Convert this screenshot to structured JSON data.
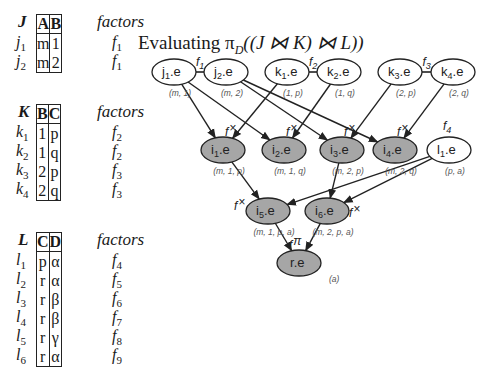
{
  "title_parts": {
    "prefix": "Evaluating ",
    "pi": "π",
    "pi_sub": "D",
    "expr": "((J ⋈ K) ⋈ L))"
  },
  "tables": [
    {
      "name": "J",
      "columns": [
        "A",
        "B"
      ],
      "factors_header": "factors",
      "rows": [
        {
          "label": "j",
          "idx": "1",
          "cells": [
            "m",
            "1"
          ],
          "factor": "f",
          "factor_idx": "1"
        },
        {
          "label": "j",
          "idx": "2",
          "cells": [
            "m",
            "2"
          ],
          "factor": "f",
          "factor_idx": "1"
        }
      ]
    },
    {
      "name": "K",
      "columns": [
        "B",
        "C"
      ],
      "factors_header": "factors",
      "rows": [
        {
          "label": "k",
          "idx": "1",
          "cells": [
            "1",
            "p"
          ],
          "factor": "f",
          "factor_idx": "2"
        },
        {
          "label": "k",
          "idx": "2",
          "cells": [
            "1",
            "q"
          ],
          "factor": "f",
          "factor_idx": "2"
        },
        {
          "label": "k",
          "idx": "3",
          "cells": [
            "2",
            "p"
          ],
          "factor": "f",
          "factor_idx": "3"
        },
        {
          "label": "k",
          "idx": "4",
          "cells": [
            "2",
            "q"
          ],
          "factor": "f",
          "factor_idx": "3"
        }
      ]
    },
    {
      "name": "L",
      "columns": [
        "C",
        "D"
      ],
      "factors_header": "factors",
      "rows": [
        {
          "label": "l",
          "idx": "1",
          "cells": [
            "p",
            "α"
          ],
          "factor": "f",
          "factor_idx": "4"
        },
        {
          "label": "l",
          "idx": "2",
          "cells": [
            "r",
            "α"
          ],
          "factor": "f",
          "factor_idx": "5"
        },
        {
          "label": "l",
          "idx": "3",
          "cells": [
            "r",
            "β"
          ],
          "factor": "f",
          "factor_idx": "6"
        },
        {
          "label": "l",
          "idx": "4",
          "cells": [
            "r",
            "β"
          ],
          "factor": "f",
          "factor_idx": "7"
        },
        {
          "label": "l",
          "idx": "5",
          "cells": [
            "r",
            "γ"
          ],
          "factor": "f",
          "factor_idx": "8"
        },
        {
          "label": "l",
          "idx": "6",
          "cells": [
            "r",
            "α"
          ],
          "factor": "f",
          "factor_idx": "9"
        }
      ]
    }
  ],
  "graph": {
    "nodes": [
      {
        "id": "j1",
        "base": "j",
        "sub": "1",
        "suffix": ".e",
        "tuple": "(m, 1)",
        "x": 174,
        "y": 72,
        "shaded": false
      },
      {
        "id": "j2",
        "base": "j",
        "sub": "2",
        "suffix": ".e",
        "tuple": "(m, 2)",
        "x": 226,
        "y": 72,
        "shaded": false
      },
      {
        "id": "k1",
        "base": "k",
        "sub": "1",
        "suffix": ".e",
        "tuple": "(1, p)",
        "x": 287,
        "y": 72,
        "shaded": false
      },
      {
        "id": "k2",
        "base": "k",
        "sub": "2",
        "suffix": ".e",
        "tuple": "(1, q)",
        "x": 339,
        "y": 72,
        "shaded": false
      },
      {
        "id": "k3",
        "base": "k",
        "sub": "3",
        "suffix": ".e",
        "tuple": "(2, p)",
        "x": 400,
        "y": 72,
        "shaded": false
      },
      {
        "id": "k4",
        "base": "k",
        "sub": "4",
        "suffix": ".e",
        "tuple": "(2, q)",
        "x": 453,
        "y": 72,
        "shaded": false
      },
      {
        "id": "i1",
        "base": "i",
        "sub": "1",
        "suffix": ".e",
        "tuple": "(m, 1, p)",
        "x": 223,
        "y": 150,
        "shaded": true
      },
      {
        "id": "i2",
        "base": "i",
        "sub": "2",
        "suffix": ".e",
        "tuple": "(m, 1, q)",
        "x": 284,
        "y": 150,
        "shaded": true
      },
      {
        "id": "i3",
        "base": "i",
        "sub": "3",
        "suffix": ".e",
        "tuple": "(m, 2, p)",
        "x": 342,
        "y": 150,
        "shaded": true
      },
      {
        "id": "i4",
        "base": "i",
        "sub": "4",
        "suffix": ".e",
        "tuple": "(m, 2, q)",
        "x": 395,
        "y": 150,
        "shaded": true
      },
      {
        "id": "l1",
        "base": "l",
        "sub": "1",
        "suffix": ".e",
        "tuple": "(p, a)",
        "x": 449,
        "y": 150,
        "shaded": false
      },
      {
        "id": "i5",
        "base": "i",
        "sub": "5",
        "suffix": ".e",
        "tuple": "(m, 1, p, a)",
        "x": 268,
        "y": 211,
        "shaded": true
      },
      {
        "id": "i6",
        "base": "i",
        "sub": "6",
        "suffix": ".e",
        "tuple": "(m, 2, p, a)",
        "x": 327,
        "y": 211,
        "shaded": true
      },
      {
        "id": "r",
        "base": "r",
        "sub": "",
        "suffix": ".e",
        "tuple": "(a)",
        "x": 299,
        "y": 263,
        "shaded": true
      }
    ],
    "factor_edges": [
      {
        "from": "j1",
        "to": "j2",
        "label": "f",
        "label_sub": "1"
      },
      {
        "from": "k1",
        "to": "k2",
        "label": "f",
        "label_sub": "2"
      },
      {
        "from": "k3",
        "to": "k4",
        "label": "f",
        "label_sub": "3"
      }
    ],
    "l1_factor": {
      "label": "f",
      "label_sub": "4"
    },
    "arrows": [
      {
        "from": "j1",
        "to": "i1"
      },
      {
        "from": "j1",
        "to": "i2"
      },
      {
        "from": "j2",
        "to": "i3"
      },
      {
        "from": "j2",
        "to": "i4"
      },
      {
        "from": "k1",
        "to": "i1"
      },
      {
        "from": "k2",
        "to": "i2"
      },
      {
        "from": "k3",
        "to": "i3"
      },
      {
        "from": "k4",
        "to": "i4"
      },
      {
        "from": "i1",
        "to": "i5"
      },
      {
        "from": "i3",
        "to": "i6"
      },
      {
        "from": "l1",
        "to": "i5"
      },
      {
        "from": "l1",
        "to": "i6"
      },
      {
        "from": "i5",
        "to": "r"
      },
      {
        "from": "i6",
        "to": "r"
      }
    ],
    "operator_labels": [
      {
        "node": "i1",
        "text": "f",
        "op": "×"
      },
      {
        "node": "i2",
        "text": "f",
        "op": "×"
      },
      {
        "node": "i3",
        "text": "f",
        "op": "×"
      },
      {
        "node": "i4",
        "text": "f",
        "op": "×"
      },
      {
        "node": "i5",
        "text": "f",
        "op": "×"
      },
      {
        "node": "i6",
        "text": "f",
        "op": "×"
      },
      {
        "node": "r",
        "text": "f",
        "op": "π"
      }
    ],
    "colors": {
      "shaded_fill": "#a6a6a6",
      "stroke": "#222222",
      "tuple_text": "#555555"
    }
  }
}
